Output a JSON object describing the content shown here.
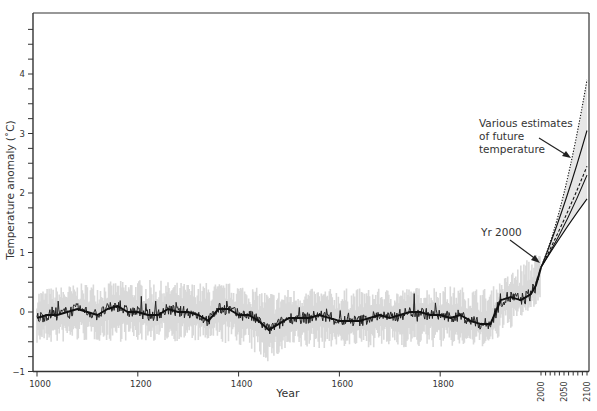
{
  "chart_data": {
    "type": "line",
    "title": "",
    "xlabel": "Year",
    "ylabel": "Temperature anomaly (˚C)",
    "xlim": [
      1000,
      2100
    ],
    "ylim": [
      -1,
      5
    ],
    "grid": false,
    "x_ticks": [
      1000,
      1200,
      1400,
      1600,
      1800,
      2000,
      2050,
      2100
    ],
    "x_tick_labels": [
      "1000",
      "1200",
      "1400",
      "1600",
      "1800",
      "2000",
      "2050",
      "2100"
    ],
    "y_ticks": [
      -1,
      0,
      1,
      2,
      3,
      4
    ],
    "y_tick_labels": [
      "−1",
      "0",
      "1",
      "2",
      "3",
      "4"
    ],
    "y_minor_step": 0.25,
    "x_scale_note": "Years 2000–2100 drawn on an expanded scale",
    "series": [
      {
        "name": "Reconstructed / measured temperature (smoothed)",
        "style": "solid-black",
        "x": [
          1000,
          1020,
          1040,
          1060,
          1080,
          1100,
          1120,
          1140,
          1160,
          1180,
          1200,
          1220,
          1240,
          1260,
          1280,
          1300,
          1320,
          1340,
          1360,
          1380,
          1400,
          1420,
          1440,
          1460,
          1480,
          1500,
          1520,
          1540,
          1560,
          1580,
          1600,
          1620,
          1640,
          1660,
          1680,
          1700,
          1720,
          1740,
          1760,
          1780,
          1800,
          1820,
          1840,
          1860,
          1880,
          1900,
          1920,
          1940,
          1960,
          1980,
          1990,
          2000
        ],
        "values": [
          -0.1,
          -0.05,
          -0.05,
          0.0,
          0.05,
          0.0,
          -0.05,
          0.05,
          0.1,
          0.0,
          0.0,
          -0.05,
          -0.05,
          0.05,
          0.0,
          0.0,
          -0.05,
          -0.15,
          0.05,
          0.05,
          -0.05,
          -0.05,
          -0.15,
          -0.3,
          -0.2,
          -0.1,
          -0.1,
          -0.1,
          -0.05,
          -0.1,
          -0.15,
          -0.15,
          -0.15,
          -0.1,
          -0.05,
          -0.1,
          -0.05,
          0.0,
          0.0,
          -0.05,
          -0.05,
          -0.1,
          -0.05,
          -0.15,
          -0.2,
          -0.2,
          0.2,
          0.25,
          0.2,
          0.3,
          0.45,
          0.75
        ]
      },
      {
        "name": "Uncertainty range (grey band)",
        "style": "light-grey-band",
        "x": [
          1000,
          1100,
          1200,
          1300,
          1400,
          1460,
          1500,
          1600,
          1700,
          1800,
          1900,
          1950,
          2000
        ],
        "upper": [
          0.35,
          0.45,
          0.5,
          0.45,
          0.45,
          0.3,
          0.35,
          0.35,
          0.35,
          0.4,
          0.35,
          0.7,
          1.0
        ],
        "lower": [
          -0.5,
          -0.45,
          -0.45,
          -0.45,
          -0.5,
          -0.8,
          -0.6,
          -0.55,
          -0.55,
          -0.55,
          -0.55,
          -0.15,
          0.2
        ]
      },
      {
        "name": "Projection (highest, dotted)",
        "style": "dotted",
        "x": [
          2000,
          2050,
          2100
        ],
        "values": [
          0.75,
          2.0,
          3.9
        ]
      },
      {
        "name": "Projection (high, solid)",
        "style": "solid",
        "x": [
          2000,
          2050,
          2100
        ],
        "values": [
          0.75,
          1.8,
          3.05
        ]
      },
      {
        "name": "Projection (middle, dashed)",
        "style": "dashed",
        "x": [
          2000,
          2050,
          2100
        ],
        "values": [
          0.75,
          1.55,
          2.45
        ]
      },
      {
        "name": "Projection (middle, solid)",
        "style": "solid",
        "x": [
          2000,
          2050,
          2100
        ],
        "values": [
          0.75,
          1.45,
          2.3
        ]
      },
      {
        "name": "Projection (lowest, solid)",
        "style": "solid",
        "x": [
          2000,
          2050,
          2100
        ],
        "values": [
          0.75,
          1.35,
          1.9
        ]
      }
    ],
    "annotations": [
      {
        "text": "Various estimates of future temperature",
        "lines": [
          "Various estimates",
          "of future",
          "temperature"
        ],
        "arrow_to": [
          2100,
          2.65
        ]
      },
      {
        "text": "Yr 2000",
        "arrow_to": [
          2000,
          0.8
        ]
      }
    ],
    "colors": {
      "axis": "#333333",
      "smoothed_line": "#111111",
      "band": "#d9d9d9",
      "projection_fill": "#e6e6e6",
      "text": "#333333"
    }
  }
}
